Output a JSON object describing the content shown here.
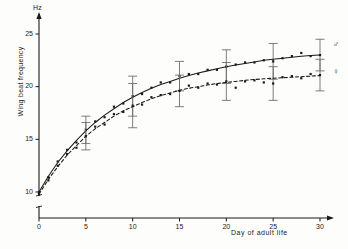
{
  "chart_data": {
    "type": "line",
    "title": "",
    "xlabel": "Day of adult life",
    "ylabel": "Wing beat frequency",
    "yunit": "Hz",
    "xlim": [
      0,
      31.5
    ],
    "ylim": [
      9,
      26.5
    ],
    "y_axis_break": true,
    "xticks": [
      0,
      5,
      10,
      15,
      20,
      25,
      30
    ],
    "xtick_labels": [
      "0",
      "5",
      "10",
      "15",
      "20",
      "25",
      "30"
    ],
    "yticks": [
      10,
      15,
      20,
      25
    ],
    "ytick_labels": [
      "10",
      "15",
      "20",
      "25"
    ],
    "grid": false,
    "legend_position": "right-inline",
    "series": [
      {
        "name": "male",
        "symbol": "♂",
        "line_style": "solid",
        "marker": "square",
        "fitted_x": [
          0,
          1,
          2,
          3,
          4,
          5,
          6,
          7,
          8,
          9,
          10,
          11,
          12,
          13,
          14,
          15,
          16,
          17,
          18,
          19,
          20,
          21,
          22,
          23,
          24,
          25,
          26,
          27,
          28,
          29,
          30
        ],
        "fitted_y": [
          10.0,
          11.5,
          12.8,
          13.9,
          14.9,
          15.8,
          16.6,
          17.3,
          17.9,
          18.5,
          19.0,
          19.45,
          19.85,
          20.2,
          20.5,
          20.8,
          21.05,
          21.3,
          21.5,
          21.7,
          21.9,
          22.05,
          22.2,
          22.35,
          22.5,
          22.6,
          22.7,
          22.8,
          22.88,
          22.95,
          23.0
        ],
        "points": [
          {
            "x": 0,
            "y": 10.0
          },
          {
            "x": 1,
            "y": 11.4
          },
          {
            "x": 2,
            "y": 12.9
          },
          {
            "x": 3,
            "y": 14.0
          },
          {
            "x": 4,
            "y": 14.7
          },
          {
            "x": 5,
            "y": 15.9
          },
          {
            "x": 6,
            "y": 16.7
          },
          {
            "x": 7,
            "y": 17.1
          },
          {
            "x": 8,
            "y": 18.1
          },
          {
            "x": 9,
            "y": 18.4
          },
          {
            "x": 10,
            "y": 19.1
          },
          {
            "x": 11,
            "y": 19.3
          },
          {
            "x": 12,
            "y": 19.9
          },
          {
            "x": 13,
            "y": 20.4
          },
          {
            "x": 14,
            "y": 20.4
          },
          {
            "x": 15,
            "y": 21.0
          },
          {
            "x": 16,
            "y": 21.2
          },
          {
            "x": 17,
            "y": 21.2
          },
          {
            "x": 18,
            "y": 21.6
          },
          {
            "x": 19,
            "y": 21.6
          },
          {
            "x": 20,
            "y": 21.9
          },
          {
            "x": 21,
            "y": 22.1
          },
          {
            "x": 22,
            "y": 22.3
          },
          {
            "x": 23,
            "y": 22.3
          },
          {
            "x": 24,
            "y": 22.5
          },
          {
            "x": 25,
            "y": 22.4
          },
          {
            "x": 26,
            "y": 22.7
          },
          {
            "x": 27,
            "y": 22.9
          },
          {
            "x": 28,
            "y": 23.2
          },
          {
            "x": 29,
            "y": 22.9
          },
          {
            "x": 30,
            "y": 23.0
          }
        ],
        "error_bars": [
          {
            "x": 5,
            "y": 15.9,
            "err": 1.3
          },
          {
            "x": 10,
            "y": 19.1,
            "err": 1.9
          },
          {
            "x": 15,
            "y": 21.0,
            "err": 1.4
          },
          {
            "x": 20,
            "y": 21.9,
            "err": 1.6
          },
          {
            "x": 25,
            "y": 22.4,
            "err": 1.7
          },
          {
            "x": 30,
            "y": 23.0,
            "err": 1.5
          }
        ]
      },
      {
        "name": "female",
        "symbol": "♀",
        "line_style": "dashed",
        "marker": "square",
        "fitted_x": [
          0,
          1,
          2,
          3,
          4,
          5,
          6,
          7,
          8,
          9,
          10,
          11,
          12,
          13,
          14,
          15,
          16,
          17,
          18,
          19,
          20,
          21,
          22,
          23,
          24,
          25,
          26,
          27,
          28,
          29,
          30
        ],
        "fitted_y": [
          9.8,
          11.2,
          12.4,
          13.5,
          14.4,
          15.3,
          16.0,
          16.6,
          17.2,
          17.7,
          18.1,
          18.5,
          18.85,
          19.15,
          19.4,
          19.65,
          19.85,
          20.0,
          20.15,
          20.3,
          20.4,
          20.5,
          20.6,
          20.68,
          20.75,
          20.8,
          20.85,
          20.9,
          20.95,
          21.0,
          21.05
        ],
        "points": [
          {
            "x": 0,
            "y": 9.8
          },
          {
            "x": 1,
            "y": 11.1
          },
          {
            "x": 2,
            "y": 12.5
          },
          {
            "x": 3,
            "y": 13.6
          },
          {
            "x": 4,
            "y": 14.2
          },
          {
            "x": 5,
            "y": 15.3
          },
          {
            "x": 6,
            "y": 16.2
          },
          {
            "x": 7,
            "y": 16.4
          },
          {
            "x": 8,
            "y": 17.4
          },
          {
            "x": 9,
            "y": 17.6
          },
          {
            "x": 10,
            "y": 18.2
          },
          {
            "x": 11,
            "y": 18.3
          },
          {
            "x": 12,
            "y": 19.0
          },
          {
            "x": 13,
            "y": 19.2
          },
          {
            "x": 14,
            "y": 19.3
          },
          {
            "x": 15,
            "y": 19.6
          },
          {
            "x": 16,
            "y": 20.1
          },
          {
            "x": 17,
            "y": 19.9
          },
          {
            "x": 18,
            "y": 20.3
          },
          {
            "x": 19,
            "y": 20.2
          },
          {
            "x": 20,
            "y": 20.5
          },
          {
            "x": 21,
            "y": 19.9
          },
          {
            "x": 22,
            "y": 20.5
          },
          {
            "x": 23,
            "y": 20.6
          },
          {
            "x": 24,
            "y": 20.4
          },
          {
            "x": 25,
            "y": 20.3
          },
          {
            "x": 26,
            "y": 20.9
          },
          {
            "x": 27,
            "y": 21.0
          },
          {
            "x": 28,
            "y": 20.8
          },
          {
            "x": 29,
            "y": 21.2
          },
          {
            "x": 30,
            "y": 21.1
          }
        ],
        "error_bars": [
          {
            "x": 5,
            "y": 15.3,
            "err": 1.3
          },
          {
            "x": 10,
            "y": 18.2,
            "err": 2.1
          },
          {
            "x": 15,
            "y": 19.6,
            "err": 1.5
          },
          {
            "x": 20,
            "y": 20.5,
            "err": 1.8
          },
          {
            "x": 25,
            "y": 20.3,
            "err": 1.6
          },
          {
            "x": 30,
            "y": 21.1,
            "err": 1.5
          }
        ]
      }
    ]
  },
  "labels": {
    "y_unit": "Hz",
    "y_title": "Wing beat frequency",
    "x_title": "Day of adult life",
    "male_glyph": "♂",
    "female_glyph": "♀"
  },
  "colors": {
    "ink": "#1a1a1a",
    "axis": "#2a2a2a",
    "background": "#fdfdfc"
  }
}
